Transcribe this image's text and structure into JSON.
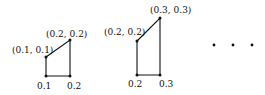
{
  "figure": {
    "shapes": [
      {
        "top_left_label": "(0.1,  0.1)",
        "top_right_label": "(0.2,  0.2)",
        "bottom_left_label": "0.1",
        "bottom_right_label": "0.2"
      },
      {
        "top_left_label": "(0.2,  0.2)",
        "top_right_label": "(0.3,  0.3)",
        "bottom_left_label": "0.2",
        "bottom_right_label": "0.3"
      }
    ],
    "continuation": "ellipsis-dots"
  }
}
